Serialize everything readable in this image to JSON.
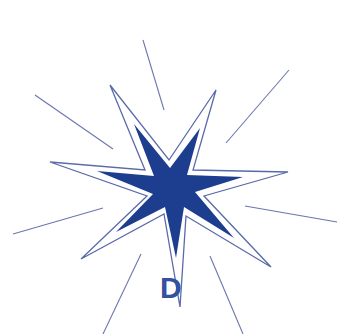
{
  "graphic": {
    "letter": "D",
    "colors": {
      "star_fill": "#1d3d8f",
      "outline": "#5a6aa8",
      "rays": "#6b77ad",
      "letter": "#34509e",
      "background": "#ffffff"
    },
    "outline_star_points": "110,85 169,160 216,90 193,170 288,172 204,196 271,267 186,216 180,307 164,214 81,259 147,196 50,162 145,170",
    "inner_star_points": "134,124 170,168 200,128 187,175 243,177 195,192 234,238 184,207 176,258 165,207 116,232 153,194 97,171 154,176",
    "rays": [
      {
        "x1": 143,
        "y1": 40,
        "x2": 164,
        "y2": 110
      },
      {
        "x1": 289,
        "y1": 70,
        "x2": 226,
        "y2": 143
      },
      {
        "x1": 35,
        "y1": 95,
        "x2": 113,
        "y2": 149
      },
      {
        "x1": 245,
        "y1": 206,
        "x2": 337,
        "y2": 222
      },
      {
        "x1": 103,
        "y1": 208,
        "x2": 13,
        "y2": 234
      },
      {
        "x1": 141,
        "y1": 254,
        "x2": 103,
        "y2": 334
      },
      {
        "x1": 210,
        "y1": 256,
        "x2": 243,
        "y2": 334
      }
    ]
  }
}
